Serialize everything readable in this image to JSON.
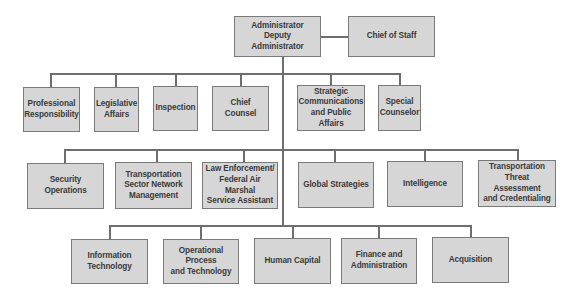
{
  "chart": {
    "top": {
      "administrator": "Administrator\nDeputy Administrator",
      "chief_of_staff": "Chief of Staff"
    },
    "tier1": [
      "Professional\nResponsibility",
      "Legislative\nAffairs",
      "Inspection",
      "Chief Counsel",
      "Strategic\nCommunications\nand Public Affairs",
      "Special\nCounselor"
    ],
    "tier2": [
      "Security Operations",
      "Transportation\nSector Network\nManagement",
      "Law Enforcement/\nFederal Air Marshal\nService Assistant",
      "Global Strategies",
      "Intelligence",
      "Transportation\nThreat Assessment\nand Credentialing"
    ],
    "tier3": [
      "Information\nTechnology",
      "Operational Process\nand Technology",
      "Human Capital",
      "Finance and\nAdministration",
      "Acquisition"
    ]
  },
  "colors": {
    "box_fill": "#d6d6d6",
    "box_border": "#7a7a7a",
    "line": "#6e6e6e",
    "text": "#3a3a3a"
  }
}
